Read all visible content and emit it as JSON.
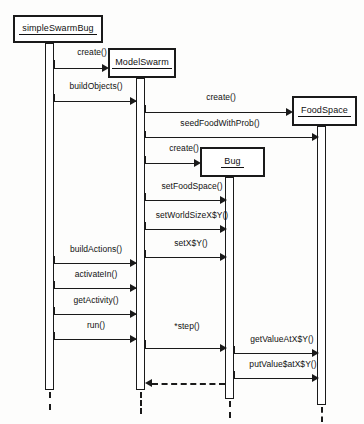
{
  "diagram": {
    "type": "uml-sequence-diagram",
    "participants": [
      {
        "id": "simpleSwarmBug",
        "label": "simpleSwarmBug",
        "box": {
          "x": 13,
          "y": 15,
          "w": 90,
          "h": 28
        },
        "lifeline_x": 49,
        "activation": {
          "x": 45,
          "y": 43,
          "w": 9,
          "h": 347
        }
      },
      {
        "id": "modelSwarm",
        "label": "ModelSwarm",
        "box": {
          "x": 108,
          "y": 48,
          "w": 68,
          "h": 30
        },
        "lifeline_x": 140,
        "activation": {
          "x": 136,
          "y": 78,
          "w": 9,
          "h": 312
        }
      },
      {
        "id": "bug",
        "label": "Bug",
        "box": {
          "x": 200,
          "y": 147,
          "w": 65,
          "h": 30
        },
        "lifeline_x": 229,
        "activation": {
          "x": 225,
          "y": 177,
          "w": 9,
          "h": 222
        }
      },
      {
        "id": "foodSpace",
        "label": "FoodSpace",
        "box": {
          "x": 292,
          "y": 96,
          "w": 65,
          "h": 30
        },
        "lifeline_x": 321,
        "activation": {
          "x": 317,
          "y": 126,
          "w": 9,
          "h": 279
        }
      }
    ],
    "messages": [
      {
        "label": "create()",
        "from": "simpleSwarmBug",
        "to": "modelSwarm",
        "y": 68,
        "kind": "call",
        "creates": true
      },
      {
        "label": "buildObjects()",
        "from": "simpleSwarmBug",
        "to": "modelSwarm",
        "y": 101,
        "kind": "call"
      },
      {
        "label": "create()",
        "from": "modelSwarm",
        "to": "foodSpace",
        "y": 112,
        "kind": "call",
        "creates": true
      },
      {
        "label": "seedFoodWithProb()",
        "from": "modelSwarm",
        "to": "foodSpace",
        "y": 137,
        "kind": "call"
      },
      {
        "label": "create()",
        "from": "modelSwarm",
        "to": "bug",
        "y": 163,
        "kind": "call",
        "creates": true
      },
      {
        "label": "setFoodSpace()",
        "from": "modelSwarm",
        "to": "bug",
        "y": 200,
        "kind": "call"
      },
      {
        "label": "setWorldSizeX$Y()",
        "from": "modelSwarm",
        "to": "bug",
        "y": 229,
        "kind": "call"
      },
      {
        "label": "setX$Y()",
        "from": "modelSwarm",
        "to": "bug",
        "y": 257,
        "kind": "call"
      },
      {
        "label": "buildActions()",
        "from": "simpleSwarmBug",
        "to": "modelSwarm",
        "y": 263,
        "kind": "call"
      },
      {
        "label": "activateIn()",
        "from": "simpleSwarmBug",
        "to": "modelSwarm",
        "y": 288,
        "kind": "call"
      },
      {
        "label": "getActivity()",
        "from": "simpleSwarmBug",
        "to": "modelSwarm",
        "y": 314,
        "kind": "call"
      },
      {
        "label": "run()",
        "from": "simpleSwarmBug",
        "to": "modelSwarm",
        "y": 339,
        "kind": "call"
      },
      {
        "label": "*step()",
        "from": "modelSwarm",
        "to": "bug",
        "y": 348,
        "kind": "call"
      },
      {
        "label": "getValueAtX$Y()",
        "from": "bug",
        "to": "foodSpace",
        "y": 353,
        "kind": "call"
      },
      {
        "label": "putValue$atX$Y()",
        "from": "bug",
        "to": "foodSpace",
        "y": 378,
        "kind": "call"
      },
      {
        "label": "",
        "from": "bug",
        "to": "modelSwarm",
        "y": 383,
        "kind": "return"
      }
    ],
    "message_labels": {
      "create_modelswarm": "create()",
      "build_objects": "buildObjects()",
      "create_foodspace": "create()",
      "seed_food_with_prob": "seedFoodWithProb()",
      "create_bug": "create()",
      "set_food_space": "setFoodSpace()",
      "set_world_size": "setWorldSizeX$Y()",
      "set_xy": "setX$Y()",
      "build_actions": "buildActions()",
      "activate_in": "activateIn()",
      "get_activity": "getActivity()",
      "run": "run()",
      "step": "*step()",
      "get_value_at_xy": "getValueAtX$Y()",
      "put_value_at_xy": "putValue$atX$Y()"
    },
    "colors": {
      "stroke": "#1a1a1a",
      "background": "#fdfdfc",
      "box_fill": "#ffffff"
    }
  }
}
